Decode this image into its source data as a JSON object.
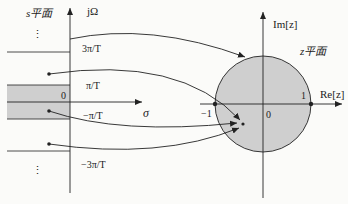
{
  "s_plane": {
    "title": "s平面",
    "imag_axis_label": "jΩ",
    "real_axis_label": "σ",
    "origin_label": "0",
    "tick_labels": {
      "three_pi": "3π/T",
      "pi": "π/T",
      "neg_pi": "−π/T",
      "neg_three_pi": "−3π/T"
    },
    "ellipsis_top": "⋮",
    "ellipsis_bottom": "⋮"
  },
  "z_plane": {
    "title": "z平面",
    "imag_axis_label": "Im[z]",
    "real_axis_label": "Re[z]",
    "origin_label": "0",
    "unit_label": "1",
    "neg_unit_label": "−1"
  },
  "colors": {
    "shade": "#cfcfcf",
    "stroke": "#222222",
    "background": "#fbfbf9"
  }
}
